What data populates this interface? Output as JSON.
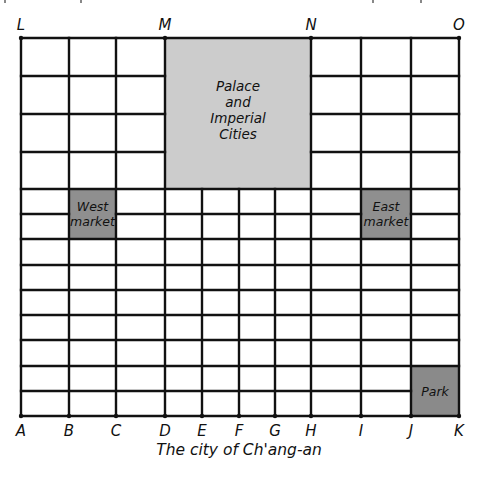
{
  "diagram": {
    "title": "The city of Ch'ang-an",
    "colors": {
      "line": "#111111",
      "palace_fill": "#cccccc",
      "market_fill": "#8f8f8f",
      "park_fill": "#8a8a8a",
      "background": "#ffffff"
    },
    "bottom_labels": [
      {
        "text": "A",
        "x": 21
      },
      {
        "text": "B",
        "x": 69
      },
      {
        "text": "C",
        "x": 116
      },
      {
        "text": "D",
        "x": 165
      },
      {
        "text": "E",
        "x": 202
      },
      {
        "text": "F",
        "x": 239
      },
      {
        "text": "G",
        "x": 275
      },
      {
        "text": "H",
        "x": 311
      },
      {
        "text": "I",
        "x": 361
      },
      {
        "text": "J",
        "x": 411
      },
      {
        "text": "K",
        "x": 459
      }
    ],
    "top_labels": [
      {
        "text": "L",
        "x": 21
      },
      {
        "text": "M",
        "x": 165
      },
      {
        "text": "N",
        "x": 311
      },
      {
        "text": "O",
        "x": 459
      }
    ],
    "regions": {
      "palace": {
        "lines": [
          "Palace",
          "and",
          "Imperial",
          "Cities"
        ]
      },
      "west_market": {
        "lines": [
          "West",
          "market"
        ]
      },
      "east_market": {
        "lines": [
          "East",
          "market"
        ]
      },
      "park": {
        "lines": [
          "Park"
        ]
      }
    }
  },
  "grid": {
    "left": 21,
    "right": 459,
    "top": 38,
    "bottom": 416,
    "upper_rows_y": [
      38,
      76,
      114,
      152,
      189
    ],
    "lower_rows_y": [
      189,
      214,
      239,
      265,
      290,
      315,
      340,
      366,
      391,
      416
    ],
    "outer_cols_x": [
      21,
      69,
      116,
      165,
      311,
      361,
      411,
      459
    ],
    "center_cols_x": [
      165,
      202,
      239,
      275,
      311
    ],
    "palace_rect": {
      "x1": 165,
      "y1": 38,
      "x2": 311,
      "y2": 189
    },
    "west_market_rect": {
      "x1": 69,
      "y1": 189,
      "x2": 116,
      "y2": 239
    },
    "east_market_rect": {
      "x1": 361,
      "y1": 189,
      "x2": 411,
      "y2": 239
    },
    "park_rect": {
      "x1": 411,
      "y1": 366,
      "x2": 459,
      "y2": 416
    }
  }
}
